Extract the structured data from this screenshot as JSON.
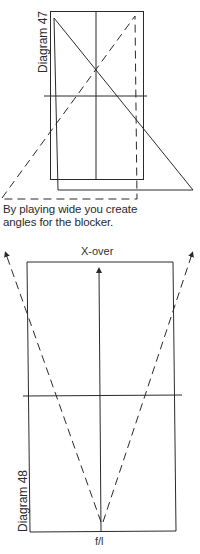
{
  "diagram47": {
    "label": "Diagram 47",
    "caption_line1": "By playing wide you create",
    "caption_line2": "angles for the blocker."
  },
  "diagram48": {
    "label": "Diagram 48",
    "top_label": "X-over",
    "bottom_label": "f/l"
  },
  "colors": {
    "line": "#2a2a2a",
    "background": "#ffffff"
  }
}
